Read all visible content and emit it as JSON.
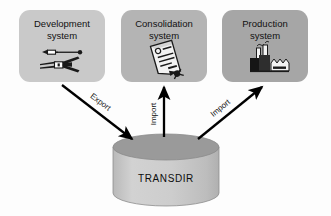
{
  "diagram": {
    "background_color": "#fdfdfd",
    "systems": [
      {
        "id": "development",
        "name_line1": "Development",
        "name_line2": "system",
        "icon": "tools-icon",
        "box_color": "#c9c9c9",
        "x": 19,
        "y": 10,
        "w": 86,
        "h": 72
      },
      {
        "id": "consolidation",
        "name_line1": "Consolidation",
        "name_line2": "system",
        "icon": "document-scroll-icon",
        "box_color": "#b4b4b4",
        "x": 121,
        "y": 10,
        "w": 86,
        "h": 72
      },
      {
        "id": "production",
        "name_line1": "Production",
        "name_line2": "system",
        "icon": "factory-icon",
        "box_color": "#a6a6a6",
        "x": 222,
        "y": 10,
        "w": 86,
        "h": 72
      }
    ],
    "repository": {
      "id": "transdir",
      "label": "TRANSDIR",
      "shape": "cylinder",
      "top_color": "#9a9a9a",
      "body_color": "#c6c6c6",
      "cx": 166,
      "top_y": 147,
      "rx": 53,
      "ry": 13,
      "body_h": 46
    },
    "flows": [
      {
        "id": "development-export",
        "label": "Export",
        "from": "development",
        "to": "transdir",
        "direction": "down-right",
        "arrow_color": "#000000"
      },
      {
        "id": "consolidation-import",
        "label": "Import",
        "from": "transdir",
        "to": "consolidation",
        "direction": "up",
        "arrow_color": "#000000"
      },
      {
        "id": "production-import",
        "label": "Import",
        "from": "transdir",
        "to": "production",
        "direction": "up-right",
        "arrow_color": "#000000"
      }
    ]
  }
}
